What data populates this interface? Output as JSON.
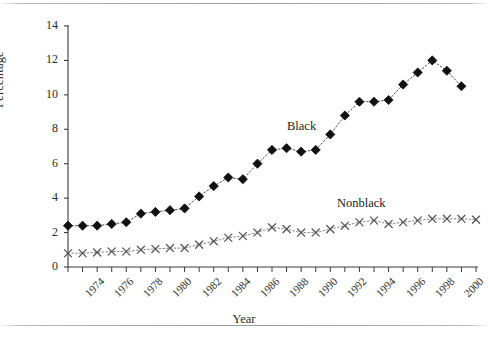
{
  "chart_data": {
    "type": "line",
    "title": "",
    "xlabel": "Year",
    "ylabel": "Percentage",
    "xlim": [
      1974,
      2002
    ],
    "ylim": [
      0,
      14
    ],
    "ytick_values": [
      0,
      2,
      4,
      6,
      8,
      10,
      12,
      14
    ],
    "grid": false,
    "legend_position": "inline-annotation",
    "x": [
      1974,
      1975,
      1976,
      1977,
      1978,
      1979,
      1980,
      1981,
      1982,
      1983,
      1984,
      1985,
      1986,
      1987,
      1988,
      1989,
      1990,
      1991,
      1992,
      1993,
      1994,
      1995,
      1996,
      1997,
      1998,
      1999,
      2000,
      2001,
      2002
    ],
    "xtick_labels": [
      "1974",
      "1976",
      "1978",
      "1980",
      "1982",
      "1984",
      "1986",
      "1988",
      "1990",
      "1992",
      "1994",
      "1996",
      "1998",
      "2000",
      "2002"
    ],
    "series": [
      {
        "name": "Black",
        "marker": "filled-diamond",
        "line_style": "dotted",
        "color": "#111111",
        "values": [
          2.4,
          2.4,
          2.4,
          2.5,
          2.6,
          3.1,
          3.2,
          3.3,
          3.4,
          4.1,
          4.7,
          5.2,
          5.1,
          6.0,
          6.8,
          6.9,
          6.7,
          6.8,
          7.7,
          8.8,
          9.6,
          9.6,
          9.7,
          10.6,
          11.3,
          12.0,
          11.4,
          10.5,
          null
        ]
      },
      {
        "name": "Nonblack",
        "marker": "x-cross",
        "line_style": "dotted",
        "color": "#555555",
        "values": [
          0.8,
          0.8,
          0.85,
          0.9,
          0.9,
          1.0,
          1.05,
          1.1,
          1.1,
          1.3,
          1.5,
          1.7,
          1.8,
          2.0,
          2.3,
          2.2,
          2.0,
          2.0,
          2.2,
          2.4,
          2.6,
          2.7,
          2.5,
          2.6,
          2.7,
          2.8,
          2.8,
          2.8,
          2.75
        ]
      }
    ],
    "annotations": [
      {
        "text": "Black",
        "x": 1993,
        "y": 7.9
      },
      {
        "text": "Nonblack",
        "x": 1997,
        "y": 4.3
      }
    ]
  },
  "axes": {
    "y_label": "Percentage",
    "x_label": "Year",
    "y_ticks": [
      "0",
      "2",
      "4",
      "6",
      "8",
      "10",
      "12",
      "14"
    ],
    "x_ticks": [
      "1974",
      "1976",
      "1978",
      "1980",
      "1982",
      "1984",
      "1986",
      "1988",
      "1990",
      "1992",
      "1994",
      "1996",
      "1998",
      "2000",
      "2002"
    ]
  },
  "annotations": {
    "black": "Black",
    "nonblack": "Nonblack"
  },
  "colors": {
    "axis": "#3a3a3a",
    "black_series": "#111111",
    "nonblack_series": "#555555",
    "frame": "#9a9a9a",
    "background": "#ffffff"
  }
}
